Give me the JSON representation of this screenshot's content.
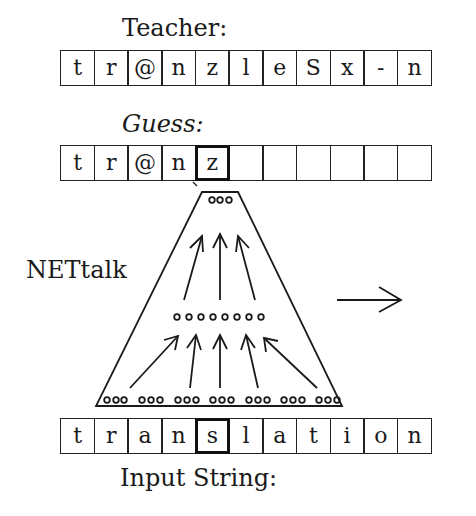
{
  "teacher": {
    "label": "Teacher:",
    "cells": [
      "t",
      "r",
      "@",
      "n",
      "z",
      "l",
      "e",
      "S",
      "x",
      "-",
      "n"
    ]
  },
  "guess": {
    "label": "Guess:",
    "cells": [
      "t",
      "r",
      "@",
      "n",
      "z",
      "",
      "",
      "",
      "",
      "",
      ""
    ],
    "highlight_index": 4
  },
  "network": {
    "label": "NETtalk",
    "output_units": 3,
    "hidden_units": 8,
    "input_groups": 7,
    "units_per_input_group": 3
  },
  "input": {
    "label": "Input String:",
    "cells": [
      "t",
      "r",
      "a",
      "n",
      "s",
      "l",
      "a",
      "t",
      "i",
      "o",
      "n"
    ],
    "highlight_index": 4
  }
}
